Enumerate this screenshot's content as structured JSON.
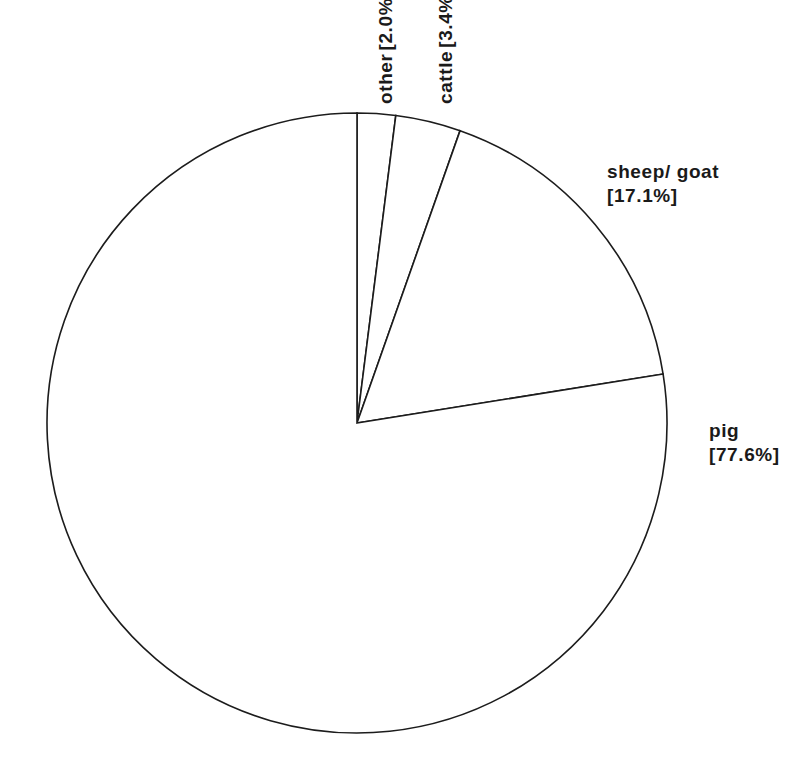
{
  "chart_data": {
    "type": "pie",
    "title": "",
    "subtitle": "",
    "xlabel": "",
    "ylabel": "",
    "legend_position": "none",
    "grid": false,
    "label_format": "name [value%]",
    "start_angle_deg": 90,
    "direction": "clockwise",
    "units": "percent",
    "categories": [
      "other",
      "cattle",
      "sheep/ goat",
      "pig"
    ],
    "values": [
      2.0,
      3.4,
      17.1,
      77.6
    ],
    "slices": [
      {
        "name": "other",
        "value": 2.0,
        "value_label": "[2.0%]",
        "label_orientation": "vertical",
        "fill": "#ffffff",
        "stroke": "#1c1c1c"
      },
      {
        "name": "cattle",
        "value": 3.4,
        "value_label": "[3.4%]",
        "label_orientation": "vertical",
        "fill": "#ffffff",
        "stroke": "#1c1c1c"
      },
      {
        "name": "sheep/ goat",
        "value": 17.1,
        "value_label": "[17.1%]",
        "label_orientation": "horizontal",
        "fill": "#ffffff",
        "stroke": "#1c1c1c"
      },
      {
        "name": "pig",
        "value": 77.6,
        "value_label": "[77.6%]",
        "label_orientation": "horizontal",
        "fill": "#ffffff",
        "stroke": "#1c1c1c"
      }
    ]
  },
  "style": {
    "background": "#ffffff",
    "line_color": "#1c1c1c",
    "text_color": "#1a1a1a"
  },
  "geometry": {
    "center_x": 357,
    "center_y": 423,
    "radius": 310
  }
}
